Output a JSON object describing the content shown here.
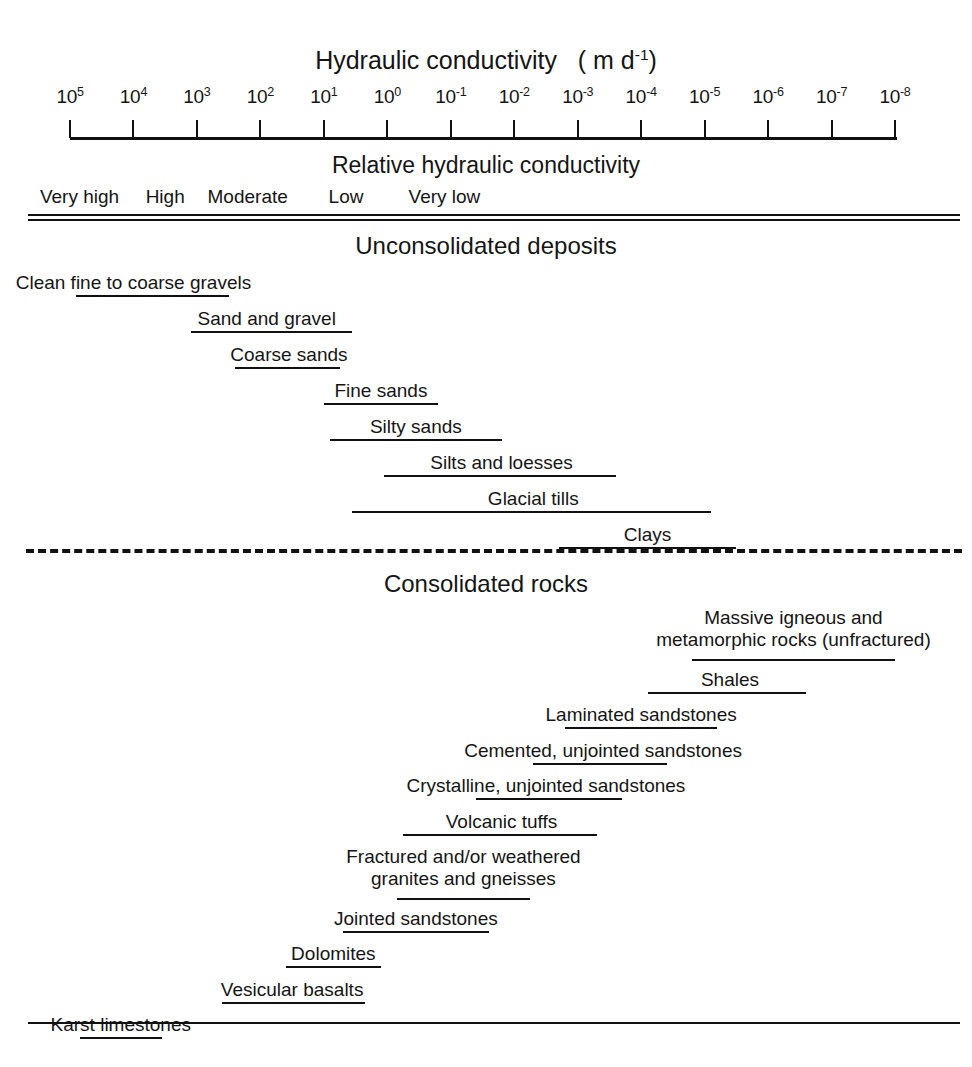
{
  "figure": {
    "axis_title_main": "Hydraulic conductivity",
    "axis_title_units_prefix": "( m d",
    "axis_title_units_exp": "-1",
    "axis_title_units_suffix": ")",
    "relative_title": "Relative hydraulic conductivity",
    "section_unconsolidated": "Unconsolidated deposits",
    "section_consolidated": "Consolidated rocks"
  },
  "axis": {
    "ticks": [
      {
        "mantissa": "10",
        "exp": "5",
        "value": 5
      },
      {
        "mantissa": "10",
        "exp": "4",
        "value": 4
      },
      {
        "mantissa": "10",
        "exp": "3",
        "value": 3
      },
      {
        "mantissa": "10",
        "exp": "2",
        "value": 2
      },
      {
        "mantissa": "10",
        "exp": "1",
        "value": 1
      },
      {
        "mantissa": "10",
        "exp": "0",
        "value": 0
      },
      {
        "mantissa": "10",
        "exp": "-1",
        "value": -1
      },
      {
        "mantissa": "10",
        "exp": "-2",
        "value": -2
      },
      {
        "mantissa": "10",
        "exp": "-3",
        "value": -3
      },
      {
        "mantissa": "10",
        "exp": "-4",
        "value": -4
      },
      {
        "mantissa": "10",
        "exp": "-5",
        "value": -5
      },
      {
        "mantissa": "10",
        "exp": "-6",
        "value": -6
      },
      {
        "mantissa": "10",
        "exp": "-7",
        "value": -7
      },
      {
        "mantissa": "10",
        "exp": "-8",
        "value": -8
      }
    ]
  },
  "relative_bands": [
    {
      "label": "Very high",
      "center_exp": 4.85
    },
    {
      "label": "High",
      "center_exp": 3.5
    },
    {
      "label": "Moderate",
      "center_exp": 2.2
    },
    {
      "label": "Low",
      "center_exp": 0.65
    },
    {
      "label": "Very low",
      "center_exp": -0.9
    }
  ],
  "chart_data": {
    "type": "bar",
    "xlabel": "Hydraulic conductivity (m d^-1)",
    "ylabel": "",
    "xscale": "log10",
    "xlim": [
      5,
      -8
    ],
    "grid": false,
    "legend": "none",
    "groups": [
      {
        "name": "Unconsolidated deposits",
        "items": [
          {
            "label": "Clean fine to coarse gravels",
            "log_min": 4.9,
            "log_max": 2.5,
            "label_center_exp": 4.0
          },
          {
            "label": "Sand and gravel",
            "log_min": 3.1,
            "log_max": 0.55,
            "label_center_exp": 1.9
          },
          {
            "label": "Coarse sands",
            "log_min": 2.4,
            "log_max": 0.75,
            "label_center_exp": 1.55
          },
          {
            "label": "Fine sands",
            "log_min": 1.0,
            "log_max": -0.8,
            "label_center_exp": 0.1
          },
          {
            "label": "Silty sands",
            "log_min": 0.9,
            "log_max": -1.8,
            "label_center_exp": -0.45
          },
          {
            "label": "Silts and loesses",
            "log_min": 0.05,
            "log_max": -3.6,
            "label_center_exp": -1.8
          },
          {
            "label": "Glacial tills",
            "log_min": 0.55,
            "log_max": -5.1,
            "label_center_exp": -2.3
          },
          {
            "label": "Clays",
            "log_min": -2.7,
            "log_max": -5.5,
            "label_center_exp": -4.1
          }
        ]
      },
      {
        "name": "Consolidated rocks",
        "items": [
          {
            "label": "Massive igneous and",
            "label2": "metamorphic rocks (unfractured)",
            "log_min": -4.8,
            "log_max": -8.0,
            "label_center_exp": -6.4
          },
          {
            "label": "Shales",
            "log_min": -4.1,
            "log_max": -6.6,
            "label_center_exp": -5.4
          },
          {
            "label": "Laminated sandstones",
            "log_min": -2.8,
            "log_max": -5.2,
            "label_center_exp": -4.0
          },
          {
            "label": "Cemented, unjointed sandstones",
            "log_min": -2.3,
            "log_max": -4.4,
            "label_center_exp": -3.4
          },
          {
            "label": "Crystalline, unjointed sandstones",
            "log_min": -1.4,
            "log_max": -3.7,
            "label_center_exp": -2.5
          },
          {
            "label": "Volcanic tuffs",
            "log_min": -0.25,
            "log_max": -3.3,
            "label_center_exp": -1.8
          },
          {
            "label": "Fractured and/or weathered",
            "label2": "granites and gneisses",
            "log_min": -0.15,
            "log_max": -2.25,
            "label_center_exp": -1.2
          },
          {
            "label": "Jointed sandstones",
            "log_min": 0.7,
            "log_max": -1.6,
            "label_center_exp": -0.45
          },
          {
            "label": "Dolomites",
            "log_min": 1.6,
            "log_max": 0.1,
            "label_center_exp": 0.85
          },
          {
            "label": "Vesicular basalts",
            "log_min": 2.6,
            "log_max": 0.35,
            "label_center_exp": 1.5
          },
          {
            "label": "Karst limestones",
            "log_min": 4.85,
            "log_max": 3.55,
            "label_center_exp": 4.2
          }
        ]
      }
    ]
  }
}
